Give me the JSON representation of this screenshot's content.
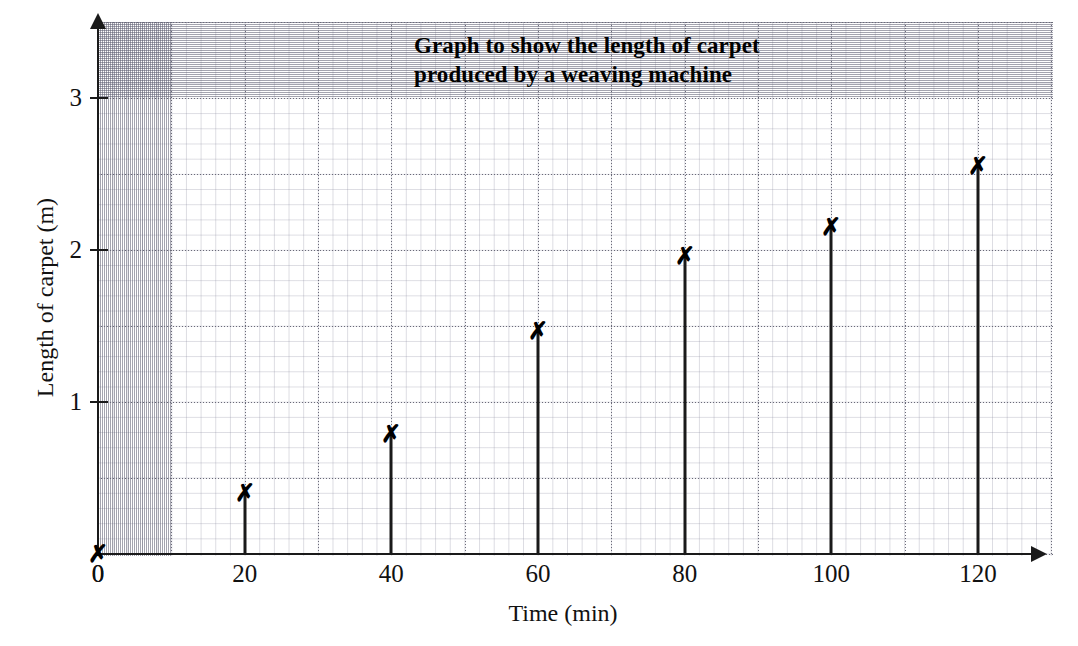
{
  "chart_data": {
    "type": "scatter",
    "title": "Graph to show the length of carpet produced by a weaving machine",
    "title_lines": [
      "Graph to show the length of carpet",
      "produced by a weaving machine"
    ],
    "xlabel": "Time (min)",
    "ylabel": "Length of carpet (m)",
    "x": [
      0,
      20,
      40,
      60,
      80,
      100,
      120
    ],
    "values": [
      0,
      0.4,
      0.79,
      1.47,
      1.96,
      2.15,
      2.55
    ],
    "series": [
      {
        "name": "Length of carpet",
        "marker": "cross",
        "values": [
          0,
          0.4,
          0.79,
          1.47,
          1.96,
          2.15,
          2.55
        ]
      }
    ],
    "xlim": [
      0,
      128
    ],
    "ylim": [
      0,
      3.5
    ],
    "xticks": [
      "0",
      "20",
      "40",
      "60",
      "80",
      "100",
      "120"
    ],
    "xtick_values": [
      0,
      20,
      40,
      60,
      80,
      100,
      120
    ],
    "yticks": [
      "1",
      "2",
      "3"
    ],
    "ytick_values": [
      1,
      2,
      3
    ],
    "grid": true,
    "grid_style": "graph-paper",
    "grid_minor_x": 2,
    "grid_minor_y": 0.1,
    "grid_major_x": 10,
    "grid_major_y": 0.5,
    "legend": false,
    "legend_position": "none",
    "colors": {
      "marker": "#000000",
      "stem": "#1a1a1a",
      "axis": "#1a1a1a",
      "grid_major": "#6a6a78",
      "grid_minor": "#8c8ca0",
      "background": "#ffffff"
    },
    "marker_glyph": "✗",
    "stems": true,
    "annotations": []
  }
}
